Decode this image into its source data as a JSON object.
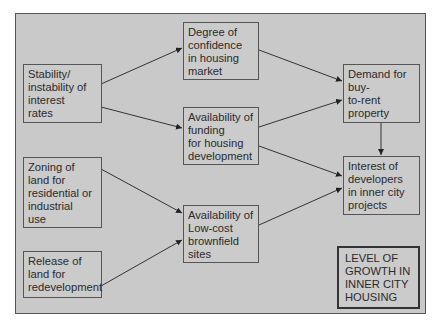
{
  "diagram": {
    "nodes": [
      {
        "id": "stability",
        "label": "Stability/\ninstability of\ninterest\nrates"
      },
      {
        "id": "zoning",
        "label": "Zoning of\nland for\nresidential or\nindustrial\nuse"
      },
      {
        "id": "release",
        "label": "Release of\nland for\nredevelopment"
      },
      {
        "id": "confidence",
        "label": "Degree of\nconfidence\nin housing\nmarket"
      },
      {
        "id": "funding",
        "label": "Availability of\nfunding\nfor housing\ndevelopment"
      },
      {
        "id": "brownfield",
        "label": "Availability of\nLow-cost\nbrownfield\nsites"
      },
      {
        "id": "demand",
        "label": "Demand for\nbuy-\nto-rent\nproperty"
      },
      {
        "id": "interest",
        "label": "Interest of\ndevelopers\nin inner city\nprojects"
      },
      {
        "id": "growth",
        "label": "LEVEL OF\nGROWTH IN\nINNER CITY\nHOUSING"
      }
    ],
    "edges": [
      {
        "from": "stability",
        "to": "confidence"
      },
      {
        "from": "stability",
        "to": "funding"
      },
      {
        "from": "zoning",
        "to": "brownfield"
      },
      {
        "from": "release",
        "to": "brownfield"
      },
      {
        "from": "confidence",
        "to": "demand"
      },
      {
        "from": "funding",
        "to": "demand"
      },
      {
        "from": "funding",
        "to": "interest"
      },
      {
        "from": "brownfield",
        "to": "interest"
      },
      {
        "from": "demand",
        "to": "interest"
      }
    ]
  }
}
